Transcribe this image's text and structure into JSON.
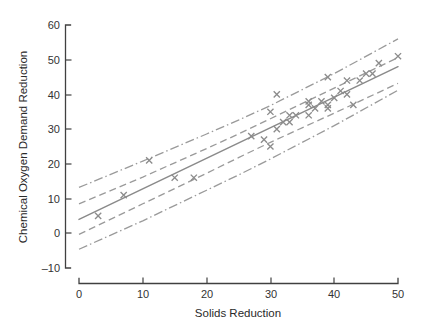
{
  "chart_data": {
    "type": "scatter",
    "title": "",
    "xlabel": "Solids Reduction",
    "ylabel": "Chemical Oxygen Demand Reduction",
    "xlim": [
      0,
      50
    ],
    "ylim": [
      -10,
      60
    ],
    "xticks": [
      0,
      10,
      20,
      30,
      40,
      50
    ],
    "yticks": [
      -10,
      0,
      10,
      20,
      30,
      40,
      50,
      60
    ],
    "xtick_labels": [
      "0",
      "10",
      "20",
      "30",
      "40",
      "50"
    ],
    "ytick_labels": [
      "-10",
      "0",
      "10",
      "20",
      "30",
      "40",
      "50",
      "60"
    ],
    "grid": false,
    "legend": "none",
    "marker": "x",
    "marker_color": "#8c8c8c",
    "line_color": "#8a8a8a",
    "axis_color": "#404040",
    "text_color": "#2a2a2a",
    "series": [
      {
        "name": "observations",
        "marker": "x",
        "x": [
          3,
          7,
          11,
          15,
          18,
          27,
          29,
          30,
          30,
          31,
          31,
          32,
          33,
          33,
          34,
          36,
          36,
          36,
          37,
          38,
          39,
          39,
          39,
          40,
          41,
          42,
          42,
          43,
          44,
          45,
          46,
          47,
          50
        ],
        "y": [
          5,
          11,
          21,
          16,
          16,
          28,
          27,
          25,
          35,
          30,
          40,
          32,
          34,
          32,
          34,
          37,
          38,
          34,
          36,
          38,
          37,
          36,
          45,
          39,
          41,
          40,
          44,
          37,
          44,
          46,
          46,
          49,
          51
        ]
      }
    ],
    "fit_line": {
      "name": "least-squares regression line",
      "style": "solid",
      "x": [
        0,
        50
      ],
      "y": [
        4.0,
        48.0
      ],
      "intercept": 4.0,
      "slope": 0.88
    },
    "confidence_band": {
      "name": "confidence limits for mean response",
      "style": "dashed",
      "x": [
        0,
        10,
        20,
        25,
        30,
        40,
        50
      ],
      "upper": [
        8.5,
        16.2,
        24.4,
        28.6,
        33.0,
        41.8,
        50.6
      ],
      "lower": [
        -0.3,
        8.5,
        17.3,
        21.8,
        26.2,
        34.6,
        43.2
      ]
    },
    "prediction_band": {
      "name": "prediction limits for single response",
      "style": "dash-dot",
      "x": [
        0,
        10,
        20,
        25,
        30,
        40,
        50
      ],
      "upper": [
        13.2,
        20.8,
        28.6,
        32.6,
        36.8,
        46.0,
        56.0
      ],
      "lower": [
        -4.6,
        3.6,
        12.4,
        16.8,
        21.4,
        31.0,
        41.2
      ]
    }
  },
  "axes": {
    "x_title": "Solids Reduction",
    "y_title": "Chemical Oxygen Demand Reduction",
    "x_tick_labels": [
      "0",
      "10",
      "20",
      "30",
      "40",
      "50"
    ],
    "y_tick_labels": [
      "60",
      "50",
      "40",
      "30",
      "20",
      "10",
      "0",
      "–10"
    ]
  }
}
